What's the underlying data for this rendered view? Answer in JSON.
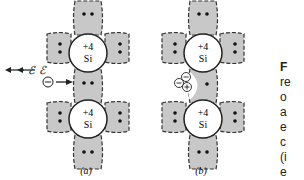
{
  "figure": {
    "panels": [
      {
        "label": "(a)",
        "atoms": [
          {
            "charge": "+4",
            "symbol": "Si"
          },
          {
            "charge": "+4",
            "symbol": "Si"
          }
        ],
        "carrier": "⊖",
        "field": "ℰ"
      },
      {
        "label": "(b)",
        "atoms": [
          {
            "charge": "+4",
            "symbol": "Si"
          },
          {
            "charge": "+4",
            "symbol": "Si"
          }
        ],
        "carriers": [
          "⊖",
          "⊖",
          "⊕"
        ],
        "field": "ℰ"
      }
    ],
    "caption_fragments": [
      "F",
      "re",
      "o",
      "a",
      "e",
      "c",
      "(i",
      "e"
    ],
    "colors": {
      "bond_fill": "#c8c8c8",
      "outline": "#222222"
    }
  }
}
